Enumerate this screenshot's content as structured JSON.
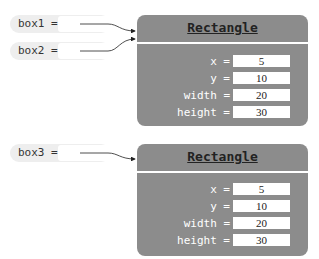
{
  "variables": [
    {
      "name": "box1 =",
      "ref": "object1"
    },
    {
      "name": "box2 =",
      "ref": "object1"
    },
    {
      "name": "box3 =",
      "ref": "object2"
    }
  ],
  "objects": [
    {
      "type": "Rectangle",
      "fields": [
        {
          "name": "x =",
          "value": "5"
        },
        {
          "name": "y =",
          "value": "10"
        },
        {
          "name": "width =",
          "value": "20"
        },
        {
          "name": "height =",
          "value": "30"
        }
      ]
    },
    {
      "type": "Rectangle",
      "fields": [
        {
          "name": "x =",
          "value": "5"
        },
        {
          "name": "y =",
          "value": "10"
        },
        {
          "name": "width =",
          "value": "20"
        },
        {
          "name": "height =",
          "value": "30"
        }
      ]
    }
  ],
  "colors": {
    "object_fill": "#8c8c8c",
    "variable_fill": "#eeeeee"
  }
}
